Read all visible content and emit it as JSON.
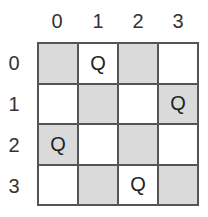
{
  "columns": [
    "0",
    "1",
    "2",
    "3"
  ],
  "rows": [
    "0",
    "1",
    "2",
    "3"
  ],
  "queen_symbol": "Q",
  "board": [
    [
      {
        "shade": "dark",
        "piece": ""
      },
      {
        "shade": "light",
        "piece": "Q"
      },
      {
        "shade": "dark",
        "piece": ""
      },
      {
        "shade": "light",
        "piece": ""
      }
    ],
    [
      {
        "shade": "light",
        "piece": ""
      },
      {
        "shade": "dark",
        "piece": ""
      },
      {
        "shade": "light",
        "piece": ""
      },
      {
        "shade": "dark",
        "piece": "Q"
      }
    ],
    [
      {
        "shade": "dark",
        "piece": "Q"
      },
      {
        "shade": "light",
        "piece": ""
      },
      {
        "shade": "dark",
        "piece": ""
      },
      {
        "shade": "light",
        "piece": ""
      }
    ],
    [
      {
        "shade": "light",
        "piece": ""
      },
      {
        "shade": "dark",
        "piece": ""
      },
      {
        "shade": "light",
        "piece": "Q"
      },
      {
        "shade": "dark",
        "piece": ""
      }
    ]
  ],
  "colors": {
    "dark_square": "#dadada",
    "light_square": "#ffffff",
    "grid_line": "#555555"
  }
}
